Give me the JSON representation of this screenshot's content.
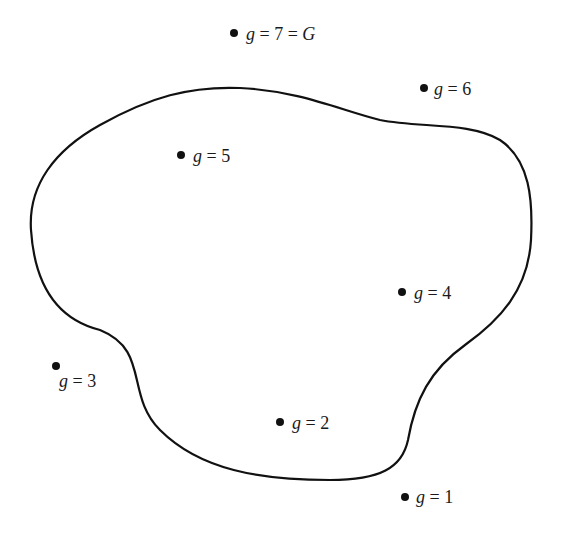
{
  "diagram": {
    "type": "region-with-points",
    "region": {
      "label": "",
      "stroke_color": "#111111",
      "path": "M 31 230 C 28 185 55 150 100 125 C 150 97 190 86 240 88 C 300 91 340 110 380 120 C 420 128 470 122 500 140 C 530 160 533 200 531 240 C 528 290 500 320 465 345 C 430 370 415 400 408 440 C 402 468 380 480 330 480 C 260 480 200 470 160 430 C 125 395 150 350 100 330 C 60 320 35 290 31 230 Z"
    },
    "points": [
      {
        "id": "g1",
        "x": 405,
        "y": 497,
        "label_prefix": "g = 1",
        "label_suffix": "",
        "label_x": 416,
        "label_y": 503
      },
      {
        "id": "g2",
        "x": 280,
        "y": 422,
        "label_prefix": "g = 2",
        "label_suffix": "",
        "label_x": 292,
        "label_y": 429
      },
      {
        "id": "g3",
        "x": 56,
        "y": 366,
        "label_prefix": "g = 3",
        "label_suffix": "",
        "label_x": 59,
        "label_y": 387
      },
      {
        "id": "g4",
        "x": 402,
        "y": 292,
        "label_prefix": "g = 4",
        "label_suffix": "",
        "label_x": 414,
        "label_y": 299
      },
      {
        "id": "g5",
        "x": 181,
        "y": 155,
        "label_prefix": "g = 5",
        "label_suffix": "",
        "label_x": 193,
        "label_y": 162
      },
      {
        "id": "g6",
        "x": 424,
        "y": 88,
        "label_prefix": "g = 6",
        "label_suffix": "",
        "label_x": 434,
        "label_y": 95
      },
      {
        "id": "g7",
        "x": 234,
        "y": 33,
        "label_prefix": "g = 7 = ",
        "label_suffix": "G",
        "label_x": 246,
        "label_y": 40
      }
    ],
    "point_color": "#111111",
    "point_radius": 4
  }
}
